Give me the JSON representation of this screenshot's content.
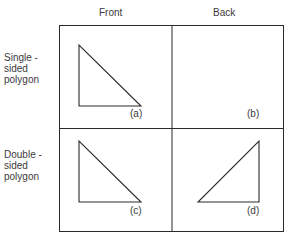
{
  "columns": [
    {
      "label": "Front"
    },
    {
      "label": "Back"
    }
  ],
  "rows": [
    {
      "label": "Single -\nsided\npolygon"
    },
    {
      "label": "Double -\nsided\npolygon"
    }
  ],
  "cells": [
    {
      "id": "a",
      "label": "(a)",
      "row": 0,
      "col": 0,
      "triangle": "left-facing",
      "visible": true
    },
    {
      "id": "b",
      "label": "(b)",
      "row": 0,
      "col": 1,
      "triangle": "none",
      "visible": false
    },
    {
      "id": "c",
      "label": "(c)",
      "row": 1,
      "col": 0,
      "triangle": "left-facing",
      "visible": true
    },
    {
      "id": "d",
      "label": "(d)",
      "row": 1,
      "col": 1,
      "triangle": "right-facing",
      "visible": true
    }
  ],
  "colors": {
    "line": "#2a2a2a",
    "text": "#3a3a3a",
    "background": "#ffffff"
  }
}
